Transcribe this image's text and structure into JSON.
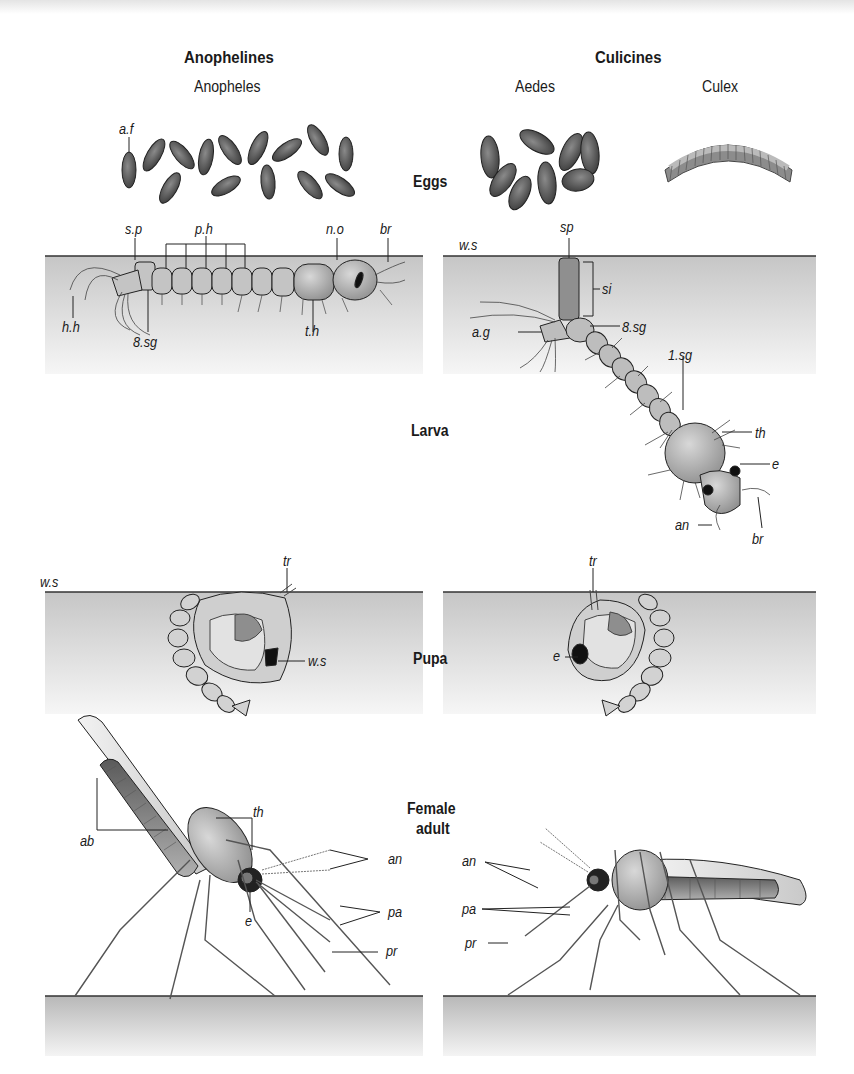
{
  "headers": {
    "anophelines": "Anophelines",
    "culicines": "Culicines"
  },
  "genera": {
    "anopheles": "Anopheles",
    "aedes": "Aedes",
    "culex": "Culex"
  },
  "stages": {
    "eggs": "Eggs",
    "larva": "Larva",
    "pupa": "Pupa",
    "adult_line1": "Female",
    "adult_line2": "adult"
  },
  "labels": {
    "eggs": {
      "anopheles_af": "a.f"
    },
    "larva_anopheles": {
      "sp": "s.p",
      "ph": "p.h",
      "no": "n.o",
      "br": "br",
      "hh": "h.h",
      "sg8": "8.sg",
      "th": "t.h"
    },
    "larva_culicine": {
      "ws": "w.s",
      "sp": "sp",
      "si": "si",
      "ag": "a.g",
      "sg8": "8.sg",
      "sg1": "1.sg",
      "th": "th",
      "e": "e",
      "an": "an",
      "br": "br"
    },
    "pupa_anopheles": {
      "ws_surface": "w.s",
      "tr": "tr",
      "ws": "w.s"
    },
    "pupa_culicine": {
      "tr": "tr",
      "e": "e"
    },
    "adult_anopheles": {
      "ab": "ab",
      "th": "th",
      "e": "e",
      "an": "an",
      "pa": "pa",
      "pr": "pr"
    },
    "adult_culicine": {
      "an": "an",
      "pa": "pa",
      "pr": "pr"
    }
  },
  "colors": {
    "water_top": "#c8c8c8",
    "water_bottom": "#f4f4f4",
    "body": "#a8a8a8",
    "egg": "#555555",
    "outline": "#222222"
  }
}
